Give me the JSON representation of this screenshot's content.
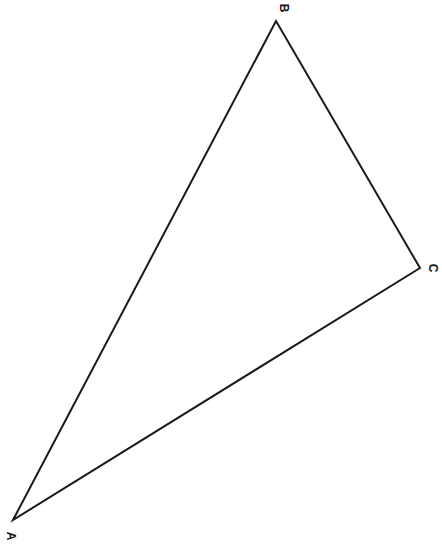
{
  "diagram": {
    "type": "triangle",
    "stroke_color": "#1a1a1a",
    "background": "#ffffff",
    "vertices": [
      {
        "label": "A",
        "x": 13,
        "y": 520,
        "label_x": 10,
        "label_y": 536
      },
      {
        "label": "B",
        "x": 276,
        "y": 21,
        "label_x": 283,
        "label_y": 8
      },
      {
        "label": "C",
        "x": 420,
        "y": 268,
        "label_x": 432,
        "label_y": 268
      }
    ],
    "edges": [
      [
        "A",
        "B"
      ],
      [
        "B",
        "C"
      ],
      [
        "C",
        "A"
      ]
    ]
  }
}
